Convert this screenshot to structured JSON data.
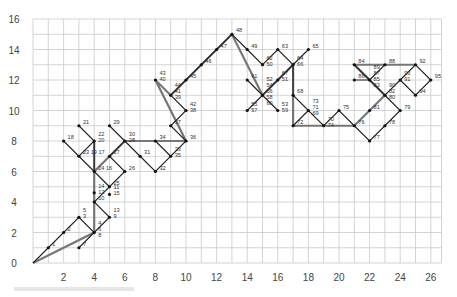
{
  "chart_data": {
    "type": "line",
    "title": "",
    "xlabel": "",
    "ylabel": "",
    "xlim": [
      0,
      26.7
    ],
    "ylim": [
      0,
      16
    ],
    "grid": true,
    "x_ticks": [
      2,
      4,
      6,
      8,
      10,
      12,
      14,
      16,
      18,
      20,
      22,
      24,
      26
    ],
    "y_ticks": [
      0,
      2,
      4,
      6,
      8,
      10,
      12,
      14,
      16
    ],
    "points": [
      {
        "label": "1",
        "x": 1,
        "y": 1
      },
      {
        "label": "2",
        "x": 2,
        "y": 2
      },
      {
        "label": "5\n3",
        "x": 3,
        "y": 3
      },
      {
        "label": "4\n6\n8",
        "x": 4,
        "y": 2
      },
      {
        "label": "7",
        "x": 3,
        "y": 1
      },
      {
        "label": "13\n9",
        "x": 5,
        "y": 3
      },
      {
        "label": "10",
        "x": 4,
        "y": 4
      },
      {
        "label": "14\n12",
        "x": 4,
        "y": 4.6
      },
      {
        "label": "11\n15",
        "x": 5,
        "y": 4.5
      },
      {
        "label": "25",
        "x": 5,
        "y": 5
      },
      {
        "label": "24 16",
        "x": 4,
        "y": 6
      },
      {
        "label": "26",
        "x": 6,
        "y": 6
      },
      {
        "label": "27",
        "x": 5,
        "y": 7
      },
      {
        "label": "23 19 17",
        "x": 3,
        "y": 7
      },
      {
        "label": "18",
        "x": 2,
        "y": 8
      },
      {
        "label": "22\n20",
        "x": 4,
        "y": 8
      },
      {
        "label": "21",
        "x": 3,
        "y": 9
      },
      {
        "label": "29",
        "x": 5,
        "y": 9
      },
      {
        "label": "30\n28",
        "x": 6,
        "y": 8
      },
      {
        "label": "31",
        "x": 7,
        "y": 7
      },
      {
        "label": "32",
        "x": 8,
        "y": 6
      },
      {
        "label": "34",
        "x": 8,
        "y": 8
      },
      {
        "label": "33\n35",
        "x": 9,
        "y": 7
      },
      {
        "label": "36",
        "x": 10,
        "y": 8
      },
      {
        "label": "37",
        "x": 9,
        "y": 9
      },
      {
        "label": "42\n38",
        "x": 10,
        "y": 10
      },
      {
        "label": "43\n40",
        "x": 8,
        "y": 12
      },
      {
        "label": "44\n41\n39",
        "x": 9,
        "y": 11
      },
      {
        "label": "45",
        "x": 10,
        "y": 12
      },
      {
        "label": "46",
        "x": 11,
        "y": 13
      },
      {
        "label": "47",
        "x": 12,
        "y": 14
      },
      {
        "label": "48",
        "x": 13,
        "y": 15
      },
      {
        "label": "49",
        "x": 14,
        "y": 14
      },
      {
        "label": "62\n50",
        "x": 15,
        "y": 13
      },
      {
        "label": "63",
        "x": 16,
        "y": 14
      },
      {
        "label": "65",
        "x": 18,
        "y": 14
      },
      {
        "label": "64\n66",
        "x": 17,
        "y": 13
      },
      {
        "label": "67\n51",
        "x": 16,
        "y": 12
      },
      {
        "label": "61",
        "x": 14,
        "y": 12
      },
      {
        "label": "52\n54\n56\n58\n60",
        "x": 15,
        "y": 11
      },
      {
        "label": "55\n57",
        "x": 14,
        "y": 10
      },
      {
        "label": "53\n59",
        "x": 16,
        "y": 10
      },
      {
        "label": "68",
        "x": 17,
        "y": 11
      },
      {
        "label": "73\n71\n69",
        "x": 18,
        "y": 10
      },
      {
        "label": "72",
        "x": 17,
        "y": 9
      },
      {
        "label": "70\n74",
        "x": 19,
        "y": 9
      },
      {
        "label": "75",
        "x": 20,
        "y": 10
      },
      {
        "label": "76",
        "x": 21,
        "y": 9
      },
      {
        "label": "77",
        "x": 22,
        "y": 8
      },
      {
        "label": "78",
        "x": 23,
        "y": 9
      },
      {
        "label": "79",
        "x": 24,
        "y": 10
      },
      {
        "label": "81",
        "x": 22,
        "y": 10
      },
      {
        "label": "86",
        "x": 21,
        "y": 12
      },
      {
        "label": "84",
        "x": 21,
        "y": 13
      },
      {
        "label": "89\n87\n85\n83",
        "x": 22,
        "y": 12
      },
      {
        "label": "88",
        "x": 23,
        "y": 13
      },
      {
        "label": "90\n82\n80",
        "x": 23,
        "y": 11
      },
      {
        "label": "93\n91",
        "x": 24,
        "y": 12
      },
      {
        "label": "92",
        "x": 25,
        "y": 13
      },
      {
        "label": "95",
        "x": 26,
        "y": 12
      },
      {
        "label": "94",
        "x": 25,
        "y": 11
      }
    ],
    "thin_path": [
      [
        0,
        0
      ],
      [
        1,
        1
      ],
      [
        2,
        2
      ],
      [
        3,
        3
      ],
      [
        4,
        2
      ],
      [
        3,
        1
      ],
      [
        4,
        2
      ],
      [
        5,
        3
      ],
      [
        4,
        4
      ],
      [
        5,
        5
      ],
      [
        4,
        6
      ],
      [
        3,
        7
      ],
      [
        2,
        8
      ],
      [
        3,
        7
      ],
      [
        4,
        8
      ],
      [
        3,
        9
      ],
      [
        4,
        8
      ],
      [
        4,
        6
      ],
      [
        5,
        5
      ],
      [
        6,
        6
      ],
      [
        5,
        7
      ],
      [
        6,
        8
      ],
      [
        5,
        9
      ],
      [
        6,
        8
      ],
      [
        7,
        7
      ],
      [
        8,
        6
      ],
      [
        9,
        7
      ],
      [
        8,
        8
      ],
      [
        9,
        7
      ],
      [
        10,
        8
      ],
      [
        9,
        9
      ],
      [
        10,
        10
      ],
      [
        9,
        11
      ],
      [
        10,
        12
      ],
      [
        11,
        13
      ],
      [
        12,
        14
      ],
      [
        13,
        15
      ],
      [
        14,
        14
      ],
      [
        15,
        13
      ],
      [
        16,
        14
      ],
      [
        17,
        13
      ],
      [
        18,
        14
      ],
      [
        17,
        13
      ],
      [
        16,
        12
      ],
      [
        15,
        11
      ],
      [
        14,
        12
      ],
      [
        15,
        11
      ],
      [
        14,
        10
      ],
      [
        15,
        11
      ],
      [
        16,
        10
      ],
      [
        15,
        11
      ],
      [
        16,
        12
      ],
      [
        17,
        13
      ],
      [
        17,
        11
      ],
      [
        18,
        10
      ],
      [
        17,
        9
      ],
      [
        18,
        10
      ],
      [
        19,
        9
      ],
      [
        20,
        10
      ],
      [
        21,
        9
      ],
      [
        22,
        8
      ],
      [
        23,
        9
      ],
      [
        24,
        10
      ],
      [
        23,
        11
      ],
      [
        22,
        12
      ],
      [
        21,
        13
      ],
      [
        22,
        12
      ],
      [
        21,
        12
      ],
      [
        22,
        12
      ],
      [
        23,
        13
      ],
      [
        22,
        12
      ],
      [
        23,
        11
      ],
      [
        24,
        12
      ],
      [
        25,
        13
      ],
      [
        26,
        12
      ],
      [
        25,
        11
      ],
      [
        24,
        12
      ]
    ],
    "thick_path": [
      [
        0,
        0
      ],
      [
        4,
        2
      ],
      [
        4,
        8
      ],
      [
        4,
        6
      ],
      [
        6,
        8
      ],
      [
        10,
        8
      ],
      [
        8,
        12
      ],
      [
        9,
        11
      ],
      [
        13,
        15
      ],
      [
        15,
        11
      ],
      [
        17,
        13
      ],
      [
        17,
        9
      ],
      [
        21,
        9
      ],
      [
        23,
        11
      ],
      [
        21,
        13
      ],
      [
        25,
        13
      ]
    ]
  },
  "axes": {
    "x_tick_labels": [
      "2",
      "4",
      "6",
      "8",
      "10",
      "12",
      "14",
      "16",
      "18",
      "20",
      "22",
      "24",
      "26"
    ],
    "y_tick_labels": [
      "0",
      "2",
      "4",
      "6",
      "8",
      "10",
      "12",
      "14",
      "16"
    ]
  }
}
